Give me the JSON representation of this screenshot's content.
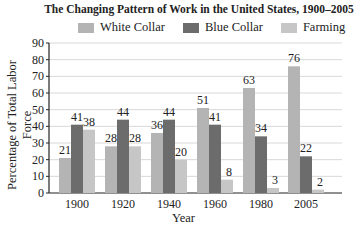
{
  "chart_data": {
    "type": "bar",
    "title": "The Changing Pattern of Work in the United States, 1900–2005",
    "xlabel": "Year",
    "ylabel": "Percentage of Total Labor Force",
    "categories": [
      "1900",
      "1920",
      "1940",
      "1960",
      "1980",
      "2005"
    ],
    "series": [
      {
        "name": "White Collar",
        "color": "#b4b4b4",
        "values": [
          21,
          28,
          36,
          51,
          63,
          76
        ]
      },
      {
        "name": "Blue Collar",
        "color": "#6c6c6c",
        "values": [
          41,
          44,
          44,
          41,
          34,
          22
        ]
      },
      {
        "name": "Farming",
        "color": "#c6c6c6",
        "values": [
          38,
          28,
          20,
          8,
          3,
          2
        ]
      }
    ],
    "ylim": [
      0,
      90
    ],
    "yticks": [
      0,
      10,
      20,
      30,
      40,
      50,
      60,
      70,
      80,
      90
    ],
    "grid": true,
    "legend_position": "top"
  },
  "legend": {
    "items": [
      {
        "label": "White Collar",
        "color": "#b4b4b4"
      },
      {
        "label": "Blue Collar",
        "color": "#6c6c6c"
      },
      {
        "label": "Farming",
        "color": "#c6c6c6"
      }
    ]
  }
}
